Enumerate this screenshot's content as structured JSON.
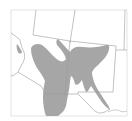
{
  "map": {
    "type": "species-range-map",
    "region": "Southwestern United States and northern Mexico",
    "colors": {
      "background": "#ffffff",
      "range_fill": "#a6a6a6",
      "borders": "#9a9a9a",
      "frame": "#d6d6d6"
    },
    "regions_shown": [
      "Utah",
      "Colorado",
      "Arizona",
      "New Mexico",
      "Nevada",
      "California",
      "Texas",
      "Sonora",
      "Chihuahua"
    ],
    "range_areas": [
      {
        "name": "Arizona central highlands and Mogollon Rim"
      },
      {
        "name": "northern New Mexico and southern Colorado"
      },
      {
        "name": "southwestern New Mexico and Chihuahua Sierra Madre"
      },
      {
        "name": "Trans-Pecos extension"
      },
      {
        "name": "lower Colorado River disjunct"
      }
    ]
  }
}
